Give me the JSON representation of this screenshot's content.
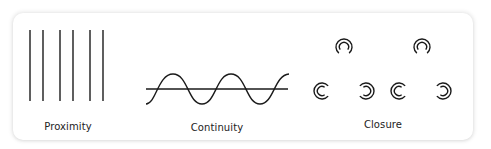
{
  "diagram": {
    "stroke_color": "#1a1a1a",
    "panels": [
      {
        "label": "Proximity",
        "icon": "grouped-vertical-lines-icon",
        "lines_x": [
          30,
          43,
          60,
          73,
          90,
          103
        ],
        "line_top": 30,
        "line_bottom": 101
      },
      {
        "label": "Continuity",
        "icon": "sine-wave-crossing-line-icon"
      },
      {
        "label": "Closure",
        "icon": "broken-circles-icon",
        "shapes": [
          {
            "cx": 344,
            "cy": 47,
            "opening": "bottom"
          },
          {
            "cx": 422,
            "cy": 47,
            "opening": "bottom"
          },
          {
            "cx": 322,
            "cy": 91,
            "opening": "right"
          },
          {
            "cx": 366,
            "cy": 91,
            "opening": "left"
          },
          {
            "cx": 399,
            "cy": 91,
            "opening": "right"
          },
          {
            "cx": 443,
            "cy": 91,
            "opening": "left"
          }
        ]
      }
    ]
  }
}
